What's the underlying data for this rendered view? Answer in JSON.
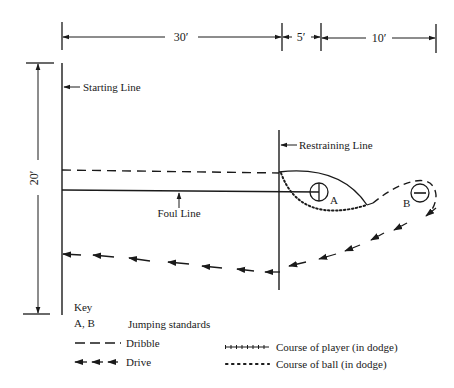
{
  "dimensions": {
    "top": [
      {
        "label": "30′"
      },
      {
        "label": "5′"
      },
      {
        "label": "10′"
      }
    ],
    "side": {
      "label": "20′"
    }
  },
  "labels": {
    "starting_line": "Starting Line",
    "restraining_line": "Restraining Line",
    "foul_line": "Foul Line",
    "standard_a": "A",
    "standard_b": "B"
  },
  "key": {
    "title": "Key",
    "items": [
      {
        "symbol": "A, B",
        "text": "Jumping standards"
      },
      {
        "symbol": "dash",
        "text": "Dribble"
      },
      {
        "symbol": "arrows",
        "text": "Drive"
      },
      {
        "symbol": "cross-line",
        "text": "Course of player (in dodge)"
      },
      {
        "symbol": "dots",
        "text": "Course of ball (in dodge)"
      }
    ]
  },
  "colors": {
    "ink": "#1a1a1a",
    "background": "#ffffff"
  }
}
